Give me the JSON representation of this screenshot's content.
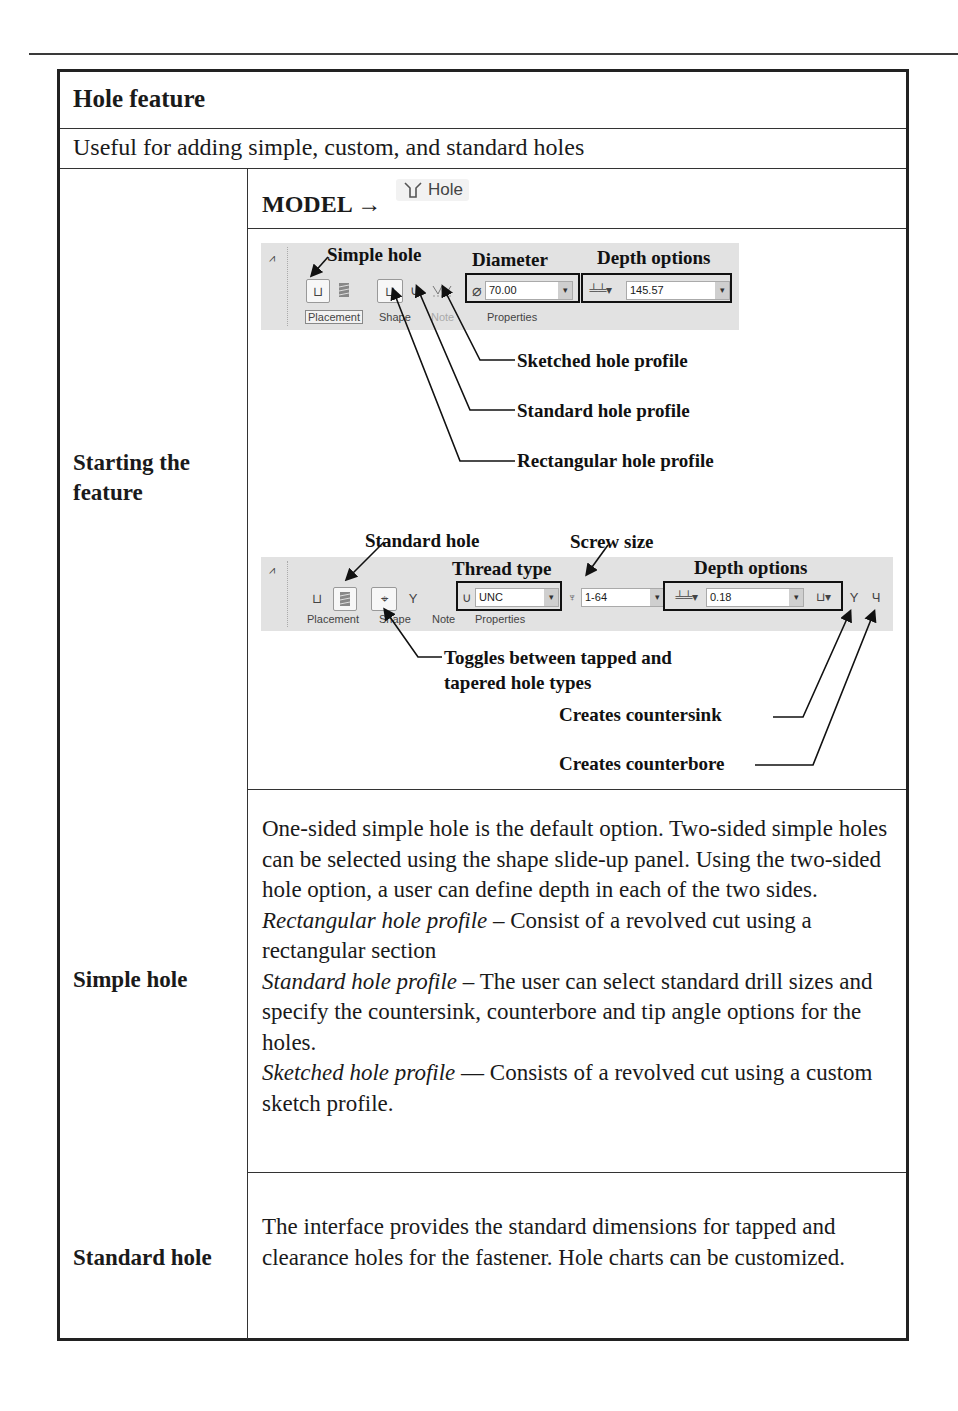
{
  "title": "Hole feature",
  "subtitle": "Useful for adding simple, custom, and standard holes",
  "rows": {
    "starting": {
      "label": "Starting the feature",
      "model_path": "MODEL →",
      "hole_button_label": "Hole",
      "toolbar1": {
        "diameter_value": "70.00",
        "depth_value": "145.57",
        "tabs": [
          "Placement",
          "Shape",
          "Note",
          "Properties"
        ],
        "annotations": {
          "simple_hole": "Simple hole",
          "diameter": "Diameter",
          "depth_options": "Depth options",
          "sketched": "Sketched hole profile",
          "standard": "Standard hole profile",
          "rectangular": "Rectangular hole profile"
        }
      },
      "toolbar2": {
        "thread_type_value": "UNC",
        "screw_size_value": "1-64",
        "depth_value": "0.18",
        "tabs": [
          "Placement",
          "Shape",
          "Note",
          "Properties"
        ],
        "annotations": {
          "standard_hole": "Standard hole",
          "thread_type": "Thread type",
          "screw_size": "Screw size",
          "depth_options": "Depth options",
          "toggle_line1": "Toggles between tapped and",
          "toggle_line2": "tapered hole types",
          "countersink": "Creates countersink",
          "counterbore": "Creates counterbore"
        }
      }
    },
    "simple": {
      "label": "Simple hole",
      "p1": "One-sided simple hole is the default option. Two-sided simple holes can be selected using the shape slide-up panel. Using the two-sided hole option, a user can define depth in each of the two sides.",
      "rect_term": "Rectangular hole profile",
      "rect_desc": " – Consist of a revolved cut using a rectangular section",
      "std_term": "Standard hole profile",
      "std_desc": " – The user can select standard drill sizes and specify the countersink, counterbore and tip angle options for the holes.",
      "sketch_term": "Sketched hole profile",
      "sketch_desc": " — Consists of a revolved cut using a custom sketch profile."
    },
    "standard": {
      "label": "Standard hole",
      "text": "The interface provides the standard dimensions for tapped and clearance holes for the fastener. Hole charts can be customized."
    }
  }
}
